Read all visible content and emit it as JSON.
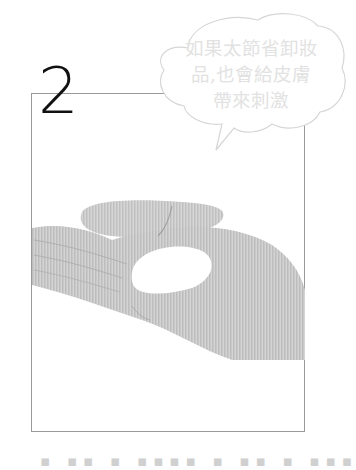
{
  "step": {
    "number": "2"
  },
  "speech_bubble": {
    "text": "如果太節省卸妝品,也會給皮膚帶來刺激",
    "lines": [
      "如果太節省卸妝",
      "品,也會給皮膚",
      "帶來刺激"
    ],
    "text_color": "#e2e2e2",
    "outline_color": "#d6d6d6"
  },
  "illustration": {
    "subject": "hand-holding-cleansing-product",
    "hand_color": "#c9c9c9",
    "product_color": "#ffffff"
  },
  "frame": {
    "border_color": "#9a9a9a"
  },
  "caption": {
    "text": "▪ ▪▪ ▪ ▪▪▪▪ ▪ ▪▪ ▪ ▪▪▪"
  }
}
